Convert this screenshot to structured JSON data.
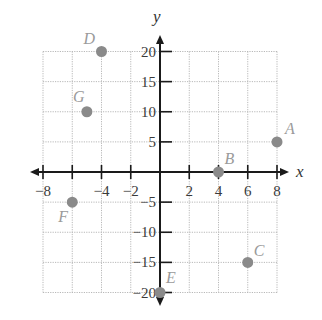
{
  "chart_data": {
    "type": "scatter",
    "title": "",
    "xlabel": "x",
    "ylabel": "y",
    "xlim": [
      -8,
      8
    ],
    "ylim": [
      -20,
      20
    ],
    "grid": true,
    "x_ticks": [
      -8,
      -4,
      -2,
      2,
      4,
      6,
      8
    ],
    "x_tick_labels": [
      "−8",
      "−4",
      "−2",
      "2",
      "4",
      "6",
      "8"
    ],
    "x_grid_step": 2,
    "y_ticks": [
      20,
      15,
      10,
      5,
      -5,
      -10,
      -15,
      -20
    ],
    "y_tick_labels": [
      "20",
      "15",
      "10",
      "5",
      "−5",
      "−10",
      "−15",
      "−20"
    ],
    "y_grid_step": 5,
    "points": [
      {
        "label": "A",
        "x": 8,
        "y": 5
      },
      {
        "label": "B",
        "x": 4,
        "y": 0
      },
      {
        "label": "C",
        "x": 6,
        "y": -15
      },
      {
        "label": "D",
        "x": -4,
        "y": 20
      },
      {
        "label": "E",
        "x": 0,
        "y": -20
      },
      {
        "label": "F",
        "x": -6,
        "y": -5
      },
      {
        "label": "G",
        "x": -5,
        "y": 10
      }
    ],
    "colors": {
      "point": "#8a8a8a",
      "label": "#9a9a9a",
      "axis": "#1a1a1a",
      "grid": "#b8b8b8"
    }
  }
}
